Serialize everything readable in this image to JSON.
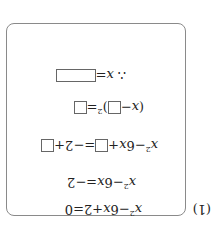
{
  "problem_label": "(1)",
  "orientation": "rotated 180 degrees",
  "steps": [
    {
      "lhs": "x²−6x+2",
      "eq": "=",
      "rhs": "0"
    },
    {
      "lhs": "x²−6x",
      "eq": "=",
      "rhs": "−2"
    },
    {
      "lhs_a": "x²−6x+",
      "eq": "=",
      "rhs_a": "−2+"
    },
    {
      "open": "(",
      "x": "x",
      "minus": "−",
      "close": ")",
      "exp": "2",
      "eq": "="
    },
    {
      "therefore": "∴",
      "x": "x",
      "eq": "="
    }
  ]
}
